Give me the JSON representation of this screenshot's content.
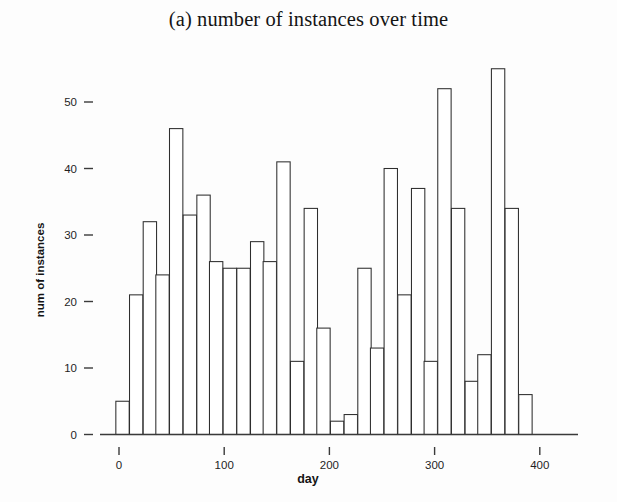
{
  "chart_data": {
    "type": "bar",
    "title": "(a) number of instances over time",
    "xlabel": "day",
    "ylabel": "num of instances",
    "xlim": [
      -5,
      430
    ],
    "ylim": [
      0,
      57
    ],
    "grid": false,
    "legend": null,
    "bin_width": 12.7,
    "xticks": [
      "0",
      "100",
      "200",
      "300",
      "400"
    ],
    "xtick_values": [
      0,
      100,
      200,
      300,
      400
    ],
    "yticks": [
      "0",
      "10",
      "20",
      "30",
      "40",
      "50"
    ],
    "ytick_values": [
      0,
      10,
      20,
      30,
      40,
      50
    ],
    "x": [
      -3,
      10,
      22,
      35,
      48,
      60,
      73,
      86,
      98,
      111,
      124,
      136,
      149,
      162,
      174,
      187,
      200,
      212,
      225,
      238,
      250,
      263,
      276,
      288,
      301,
      314,
      326,
      339,
      352,
      364,
      377,
      390,
      402,
      415
    ],
    "categories": [
      "0",
      "10",
      "22",
      "35",
      "48",
      "60",
      "73",
      "86",
      "98",
      "111",
      "124",
      "136",
      "149",
      "162",
      "174",
      "187",
      "200",
      "212",
      "225",
      "238",
      "250",
      "263",
      "276",
      "288",
      "301",
      "314",
      "326",
      "339",
      "352",
      "364",
      "377",
      "390",
      "402",
      "415"
    ],
    "values": [
      5,
      21,
      32,
      24,
      46,
      33,
      36,
      26,
      25,
      25,
      29,
      26,
      41,
      11,
      34,
      16,
      2,
      3,
      25,
      13,
      40,
      21,
      37,
      11,
      52,
      34,
      8,
      12,
      55,
      34,
      6,
      0,
      0,
      0
    ],
    "bars": [
      {
        "day": 0,
        "value": 5
      },
      {
        "day": 13,
        "value": 21
      },
      {
        "day": 26,
        "value": 32
      },
      {
        "day": 38,
        "value": 24
      },
      {
        "day": 51,
        "value": 46
      },
      {
        "day": 64,
        "value": 33
      },
      {
        "day": 77,
        "value": 36
      },
      {
        "day": 89,
        "value": 26
      },
      {
        "day": 102,
        "value": 25
      },
      {
        "day": 115,
        "value": 25
      },
      {
        "day": 128,
        "value": 29
      },
      {
        "day": 140,
        "value": 26
      },
      {
        "day": 153,
        "value": 41
      },
      {
        "day": 166,
        "value": 11
      },
      {
        "day": 179,
        "value": 34
      },
      {
        "day": 191,
        "value": 16
      },
      {
        "day": 204,
        "value": 2
      },
      {
        "day": 217,
        "value": 3
      },
      {
        "day": 230,
        "value": 25
      },
      {
        "day": 242,
        "value": 13
      },
      {
        "day": 255,
        "value": 40
      },
      {
        "day": 268,
        "value": 21
      },
      {
        "day": 281,
        "value": 37
      },
      {
        "day": 293,
        "value": 11
      },
      {
        "day": 306,
        "value": 52
      },
      {
        "day": 319,
        "value": 34
      },
      {
        "day": 332,
        "value": 8
      },
      {
        "day": 344,
        "value": 12
      },
      {
        "day": 357,
        "value": 55
      },
      {
        "day": 370,
        "value": 34
      },
      {
        "day": 383,
        "value": 6
      }
    ]
  },
  "figure": {
    "title": "(a) number of instances over time",
    "axis_x_label": "day",
    "axis_y_label": "num of instances",
    "bar_fill_color": "#ffffff",
    "bar_stroke_color": "#2e2e2e",
    "axis_color": "#3a3a3a",
    "background_color": "#fdfdfd",
    "text_color": "#141414"
  }
}
